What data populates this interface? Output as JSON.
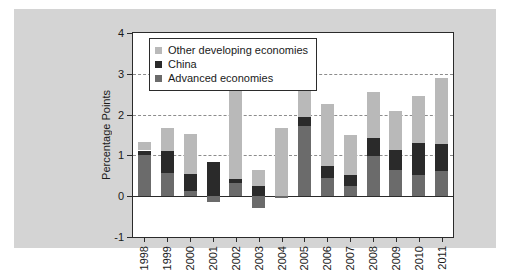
{
  "figure": {
    "background": "#ffffff",
    "panel_background": "#d4d4d4"
  },
  "chart_data": {
    "type": "bar",
    "subtype": "stacked-bar-with-negatives",
    "title": "",
    "xlabel": "",
    "ylabel": "Percentage Points",
    "ylim": [
      -1,
      4
    ],
    "yticks": [
      "4",
      "3",
      "2",
      "1",
      "0",
      "-1"
    ],
    "ytick_values": [
      4,
      3,
      2,
      1,
      0,
      -1
    ],
    "grid": "horizontal dashed gridlines at 1, 2, 3",
    "gridlines_at": [
      3,
      2,
      1
    ],
    "legend_position": "top-left inside plot",
    "categories": [
      "1998",
      "1999",
      "2000",
      "2001",
      "2002",
      "2003",
      "2004",
      "2005",
      "2006",
      "2007",
      "2008",
      "2009",
      "2010",
      "2011"
    ],
    "series": [
      {
        "name": "Advanced economies",
        "color": "#6b6b6b",
        "values": [
          1.0,
          0.57,
          0.12,
          -0.15,
          0.33,
          -0.3,
          -0.05,
          1.72,
          0.44,
          0.26,
          0.98,
          0.63,
          0.51,
          0.62
        ]
      },
      {
        "name": "China",
        "color": "#2a2a2a",
        "values": [
          0.12,
          0.55,
          0.43,
          0.85,
          0.1,
          0.24,
          0.0,
          0.23,
          0.29,
          0.26,
          0.45,
          0.5,
          0.79,
          0.65
        ]
      },
      {
        "name": "Other developing economies",
        "color": "#b9b9b9",
        "values": [
          0.22,
          0.55,
          0.97,
          0.0,
          2.14,
          0.41,
          1.66,
          1.42,
          1.52,
          0.98,
          1.12,
          0.95,
          1.15,
          1.63
        ]
      }
    ],
    "stack_order_bottom_to_top": [
      "Advanced economies",
      "China",
      "Other developing economies"
    ],
    "totals": [
      1.34,
      1.67,
      1.52,
      0.7,
      2.57,
      0.35,
      1.61,
      3.37,
      2.25,
      1.5,
      2.55,
      2.08,
      2.45,
      2.9
    ]
  },
  "legend": {
    "items": [
      {
        "label": "Other developing economies",
        "color": "#b9b9b9"
      },
      {
        "label": "China",
        "color": "#2a2a2a"
      },
      {
        "label": "Advanced economies",
        "color": "#6b6b6b"
      }
    ]
  }
}
